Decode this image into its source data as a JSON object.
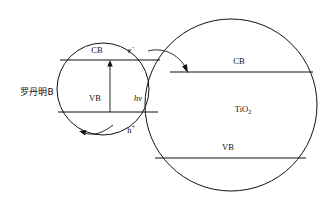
{
  "diagram": {
    "background_color": "#ffffff",
    "line_color": "#111111",
    "left_particle": {
      "name": "left-particle",
      "label": "罗丹明B",
      "label_meaning": "Rhodamine B",
      "conduction_band_label": "CB",
      "valence_band_label": "VB",
      "electron_label": "e",
      "electron_charge": "−",
      "hole_label": "h",
      "hole_charge": "+",
      "excitation_label": "hν"
    },
    "right_particle": {
      "name": "right-particle",
      "label_main": "TiO",
      "label_sub": "2",
      "conduction_band_label": "CB",
      "valence_band_label": "VB"
    },
    "arrows": {
      "excitation_arrow_name": "excitation-arrow",
      "electron_injection_arrow_name": "electron-injection-arrow",
      "hole_transfer_arrow_name": "hole-transfer-arrow"
    }
  }
}
